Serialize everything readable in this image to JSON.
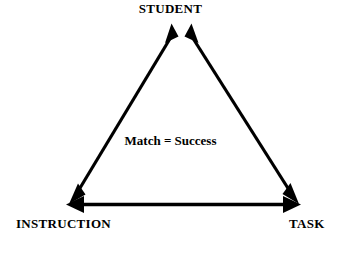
{
  "diagram": {
    "type": "triangle-relationship-diagram",
    "background_color": "#ffffff",
    "stroke_color": "#000000",
    "center_text": "Match = Success",
    "vertices": [
      {
        "id": "student",
        "label": "STUDENT",
        "position": "top",
        "x": 181,
        "y": 22
      },
      {
        "id": "instruction",
        "label": "INSTRUCTION",
        "position": "bottom-left",
        "x": 70,
        "y": 203
      },
      {
        "id": "task",
        "label": "TASK",
        "position": "bottom-right",
        "x": 297,
        "y": 203
      }
    ],
    "connections": [
      {
        "id": "student-instruction",
        "from": "student",
        "to": "instruction",
        "arrowheads": "both"
      },
      {
        "id": "student-task",
        "from": "student",
        "to": "task",
        "arrowheads": "both"
      },
      {
        "id": "instruction-task",
        "from": "instruction",
        "to": "task",
        "arrowheads": "both"
      }
    ]
  }
}
